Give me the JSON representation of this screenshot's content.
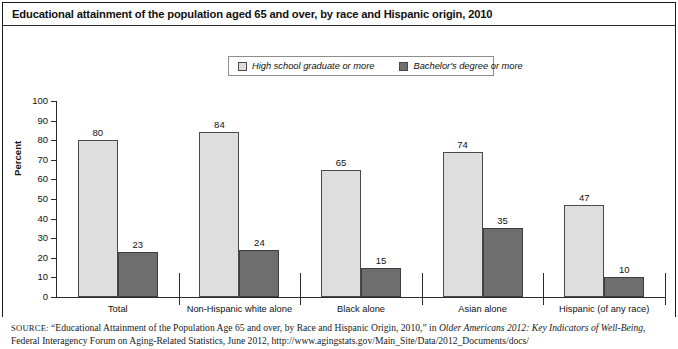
{
  "figure": {
    "title": "Educational attainment of the population aged 65 and over, by race and Hispanic origin, 2010"
  },
  "legend": {
    "items": [
      {
        "label": "High school graduate or more",
        "color": "#dedede",
        "swatch": "light"
      },
      {
        "label": "Bachelor's degree or more",
        "color": "#6e6e6e",
        "swatch": "dark"
      }
    ]
  },
  "axis": {
    "ylabel": "Percent",
    "yticks": [
      "0",
      "10",
      "20",
      "30",
      "40",
      "50",
      "60",
      "70",
      "80",
      "90",
      "100"
    ]
  },
  "source": {
    "prefix": "SOURCE:",
    "line1_a": " “Educational Attainment of the Population Age 65 and over, by Race and Hispanic Origin, 2010,” in ",
    "line1_italic": "Older Americans 2012: Key Indicators of",
    "line2_italic": "Well-Being",
    "line2_b": ", Federal Interagency Forum on Aging-Related Statistics, June 2012, http://www.agingstats.gov/Main_Site/Data/2012_Documents/docs/"
  },
  "chart_data": {
    "type": "bar",
    "title": "Educational attainment of the population aged 65 and over, by race and Hispanic origin, 2010",
    "xlabel": "",
    "ylabel": "Percent",
    "ylim": [
      0,
      100
    ],
    "ytick_step": 10,
    "grid": false,
    "legend_position": "top-center",
    "categories": [
      "Total",
      "Non-Hispanic white alone",
      "Black alone",
      "Asian alone",
      "Hispanic (of any race)"
    ],
    "series": [
      {
        "name": "High school graduate or more",
        "color": "#dedede",
        "values": [
          80,
          84,
          65,
          74,
          47
        ]
      },
      {
        "name": "Bachelor's degree or more",
        "color": "#6e6e6e",
        "values": [
          23,
          24,
          15,
          35,
          10
        ]
      }
    ]
  }
}
